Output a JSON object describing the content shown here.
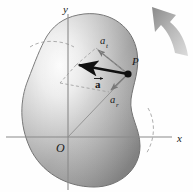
{
  "figure": {
    "name": "rotating-rigid-body-acceleration-diagram",
    "type": "physics-vector-diagram",
    "background_color": "#ffffff"
  },
  "axes": {
    "x_label": "x",
    "y_label": "y",
    "origin_label": "O",
    "axis_color": "#8a8a8a",
    "origin_px": {
      "x": 68,
      "y": 137
    },
    "x_axis": {
      "x1": 6,
      "y1": 137,
      "x2": 172,
      "y2": 137
    },
    "y_axis": {
      "x1": 68,
      "y1": 14,
      "x2": 68,
      "y2": 190
    },
    "x_label_px": {
      "x": 177,
      "y": 141
    },
    "y_label_px": {
      "x": 64,
      "y": 12
    },
    "origin_label_px": {
      "x": 59,
      "y": 150
    }
  },
  "body": {
    "name": "rigid-body-blob",
    "fill_light": "#f2f2f2",
    "fill_mid": "#b9b9b9",
    "fill_dark": "#7d7d7d",
    "outline_color": "#6e6e6e",
    "description": "shaded peanut-shaped rigid body rotating about O"
  },
  "point": {
    "label": "P",
    "label_px": {
      "x": 134,
      "y": 63
    },
    "marker_px": {
      "x": 128,
      "y": 74
    },
    "marker_color": "#111111"
  },
  "vectors": [
    {
      "name": "total-acceleration",
      "label": "a",
      "label_px": {
        "x": 99,
        "y": 84
      },
      "style": "bold-black-with-overarrow",
      "color": "#111111",
      "from_px": {
        "x": 128,
        "y": 74
      },
      "to_px": {
        "x": 76,
        "y": 65
      }
    },
    {
      "name": "tangential-acceleration",
      "label": "a",
      "subscript": "t",
      "label_px": {
        "x": 105,
        "y": 41
      },
      "style": "thin-gray",
      "color": "#6f6f6f",
      "from_px": {
        "x": 128,
        "y": 74
      },
      "to_px": {
        "x": 96,
        "y": 48
      }
    },
    {
      "name": "radial-acceleration",
      "label": "a",
      "subscript": "r",
      "label_px": {
        "x": 114,
        "y": 100
      },
      "style": "thin-gray",
      "color": "#6f6f6f",
      "from_px": {
        "x": 128,
        "y": 74
      },
      "to_px": {
        "x": 109,
        "y": 92
      }
    }
  ],
  "construction_lines": {
    "name": "parallelogram-dashes",
    "color": "#9a9a9a",
    "radius_line": {
      "from_px": {
        "x": 68,
        "y": 137
      },
      "to_px": {
        "x": 128,
        "y": 74
      }
    }
  },
  "rotation_arrow": {
    "name": "rotation-direction-arrow",
    "color_start": "#d8d8d8",
    "color_end": "#8c8c8c",
    "direction": "counterclockwise-up-left"
  },
  "dashed_arcs": [
    {
      "name": "arc-left",
      "color": "#a5a5a5"
    },
    {
      "name": "arc-right",
      "color": "#a5a5a5"
    }
  ]
}
